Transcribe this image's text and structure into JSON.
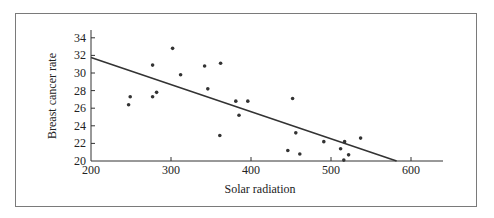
{
  "chart_data": {
    "type": "scatter",
    "title": "",
    "xlabel": "Solar radiation",
    "ylabel": "Breast cancer rate",
    "xlim": [
      200,
      640
    ],
    "ylim": [
      20,
      35
    ],
    "xticks": [
      200,
      300,
      400,
      500,
      600
    ],
    "yticks": [
      20,
      22,
      24,
      26,
      28,
      30,
      32,
      34
    ],
    "grid": false,
    "legend": "none",
    "points": [
      {
        "x": 247,
        "y": 26.4
      },
      {
        "x": 249,
        "y": 27.3
      },
      {
        "x": 277,
        "y": 27.3
      },
      {
        "x": 277,
        "y": 30.9
      },
      {
        "x": 282,
        "y": 27.8
      },
      {
        "x": 302,
        "y": 32.8
      },
      {
        "x": 312,
        "y": 29.8
      },
      {
        "x": 342,
        "y": 30.8
      },
      {
        "x": 346,
        "y": 28.2
      },
      {
        "x": 361,
        "y": 22.9
      },
      {
        "x": 362,
        "y": 31.1
      },
      {
        "x": 381,
        "y": 26.8
      },
      {
        "x": 385,
        "y": 25.2
      },
      {
        "x": 396,
        "y": 26.8
      },
      {
        "x": 446,
        "y": 21.2
      },
      {
        "x": 452,
        "y": 27.1
      },
      {
        "x": 456,
        "y": 23.2
      },
      {
        "x": 461,
        "y": 20.8
      },
      {
        "x": 491,
        "y": 22.2
      },
      {
        "x": 512,
        "y": 21.4
      },
      {
        "x": 516,
        "y": 20.1
      },
      {
        "x": 517,
        "y": 22.2
      },
      {
        "x": 522,
        "y": 20.7
      },
      {
        "x": 537,
        "y": 22.6
      }
    ],
    "regression_line": {
      "x": [
        200,
        582
      ],
      "y": [
        31.75,
        20
      ]
    },
    "colors": {
      "points": "#333333",
      "line": "#333333",
      "axis": "#333333"
    }
  }
}
